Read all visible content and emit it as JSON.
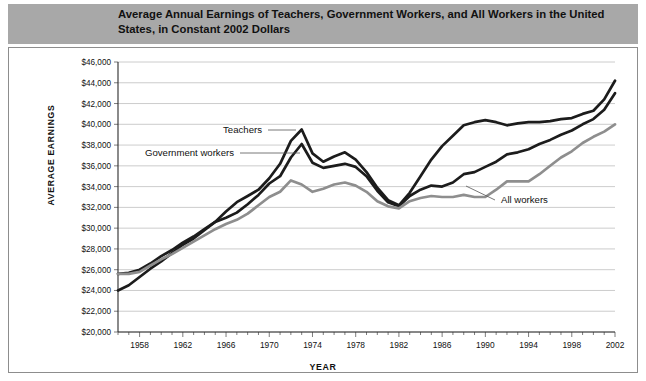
{
  "figure": {
    "tab_label": "Figure 1.2",
    "title": "Average Annual Earnings of Teachers, Government Workers, and All Workers in the United States, in Constant 2002 Dollars"
  },
  "chart_data": {
    "type": "line",
    "title": "Average Annual Earnings of Teachers, Government Workers, and All Workers in the United States, in Constant 2002 Dollars",
    "xlabel": "YEAR",
    "ylabel": "AVERAGE EARNINGS",
    "xlim": [
      1956,
      2002
    ],
    "ylim": [
      20000,
      46000
    ],
    "grid": true,
    "legend_position": "inline-annotations",
    "ytick_labels": [
      "$46,000",
      "$44,000",
      "$42,000",
      "$40,000",
      "$38,000",
      "$36,000",
      "$34,000",
      "$32,000",
      "$30,000",
      "$28,000",
      "$26,000",
      "$24,000",
      "$22,000",
      "$20,000"
    ],
    "yticks": [
      46000,
      44000,
      42000,
      40000,
      38000,
      36000,
      34000,
      32000,
      30000,
      28000,
      26000,
      24000,
      22000,
      20000
    ],
    "xtick_labels": [
      "1958",
      "1962",
      "1966",
      "1970",
      "1974",
      "1978",
      "1982",
      "1986",
      "1990",
      "1994",
      "1998",
      "2002"
    ],
    "xticks": [
      1958,
      1962,
      1966,
      1970,
      1974,
      1978,
      1982,
      1986,
      1990,
      1994,
      1998,
      2002
    ],
    "x": [
      1956,
      1957,
      1958,
      1959,
      1960,
      1961,
      1962,
      1963,
      1964,
      1965,
      1966,
      1967,
      1968,
      1969,
      1970,
      1971,
      1972,
      1973,
      1974,
      1975,
      1976,
      1977,
      1978,
      1979,
      1980,
      1981,
      1982,
      1983,
      1984,
      1985,
      1986,
      1987,
      1988,
      1989,
      1990,
      1991,
      1992,
      1993,
      1994,
      1995,
      1996,
      1997,
      1998,
      1999,
      2000,
      2001,
      2002
    ],
    "series": [
      {
        "name": "Teachers",
        "color": "#1c1c1c",
        "label_x": 1972,
        "values": [
          24000,
          24500,
          25300,
          26100,
          26800,
          27600,
          28400,
          29000,
          29800,
          30600,
          31600,
          32500,
          33100,
          33700,
          34800,
          36200,
          38400,
          39500,
          37200,
          36400,
          36900,
          37300,
          36600,
          35400,
          33900,
          32700,
          32200,
          33400,
          35000,
          36600,
          37900,
          38900,
          39900,
          40200,
          40400,
          40200,
          39900,
          40100,
          40200,
          40200,
          40300,
          40500,
          40600,
          41000,
          41300,
          42400,
          44200
        ]
      },
      {
        "name": "Government workers",
        "color": "#1c1c1c",
        "label_x": 1966,
        "values": [
          25600,
          25700,
          26000,
          26600,
          27300,
          27900,
          28600,
          29200,
          29900,
          30600,
          31000,
          31500,
          32300,
          33200,
          34300,
          35000,
          36800,
          38100,
          36300,
          35800,
          36000,
          36200,
          35900,
          35000,
          33600,
          32500,
          32100,
          33100,
          33700,
          34100,
          34000,
          34400,
          35200,
          35400,
          35900,
          36400,
          37100,
          37300,
          37600,
          38100,
          38500,
          39000,
          39400,
          40000,
          40500,
          41400,
          43000
        ]
      },
      {
        "name": "All workers",
        "color": "#8e8e8e",
        "label_x": 1990,
        "values": [
          25600,
          25600,
          25800,
          26400,
          27000,
          27500,
          28100,
          28700,
          29300,
          29900,
          30400,
          30800,
          31400,
          32200,
          33000,
          33500,
          34600,
          34200,
          33500,
          33800,
          34200,
          34400,
          34100,
          33500,
          32600,
          32100,
          31900,
          32600,
          32900,
          33100,
          33000,
          33000,
          33200,
          33000,
          33000,
          33700,
          34500,
          34500,
          34500,
          35200,
          36000,
          36800,
          37400,
          38200,
          38800,
          39300,
          40000
        ]
      }
    ],
    "annotations": [
      {
        "text": "Teachers",
        "series": "Teachers"
      },
      {
        "text": "Government workers",
        "series": "Government workers"
      },
      {
        "text": "All workers",
        "series": "All workers"
      }
    ]
  }
}
